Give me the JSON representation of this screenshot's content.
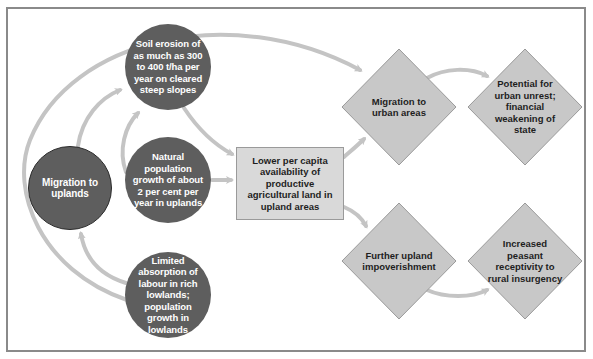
{
  "diagram": {
    "colors": {
      "circle_fill": "#5e5e5e",
      "circle_text": "#ffffff",
      "box_fill": "#d9d9d9",
      "diamond_fill": "#c8c8c8",
      "arrow": "#c4c4c4",
      "frame": "#8a8a8a"
    },
    "nodes": {
      "migration_uplands": "Migration to uplands",
      "soil_erosion": "Soil erosion of as much as 300 to 400 t/ha per year on cleared steep slopes",
      "natural_growth": "Natural population growth of about 2 per cent per year in uplands",
      "limited_absorption": "Limited absorption of labour in rich lowlands; population growth in lowlands",
      "lower_availability": "Lower per capita availability of productive agricultural land in upland areas",
      "migration_urban": "Migration to urban areas",
      "urban_unrest": "Potential for urban unrest; financial weakening of state",
      "upland_impoverishment": "Further upland impoverishment",
      "rural_insurgency": "Increased peasant receptivity to rural insurgency"
    },
    "edges": [
      {
        "from": "migration_uplands",
        "to": "soil_erosion"
      },
      {
        "from": "natural_growth",
        "to": "soil_erosion"
      },
      {
        "from": "soil_erosion",
        "to": "lower_availability"
      },
      {
        "from": "natural_growth",
        "to": "lower_availability"
      },
      {
        "from": "limited_absorption",
        "to": "migration_uplands"
      },
      {
        "from": "limited_absorption",
        "to": "migration_urban"
      },
      {
        "from": "lower_availability",
        "to": "migration_urban"
      },
      {
        "from": "lower_availability",
        "to": "upland_impoverishment"
      },
      {
        "from": "migration_urban",
        "to": "urban_unrest"
      },
      {
        "from": "upland_impoverishment",
        "to": "rural_insurgency"
      }
    ]
  }
}
